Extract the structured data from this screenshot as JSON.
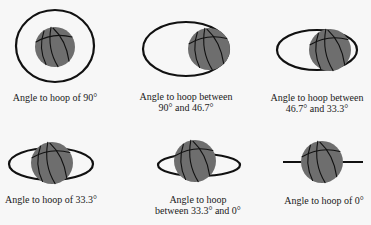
{
  "figure": {
    "colors": {
      "background": "#f7f7f7",
      "hoop_stroke": "#111111",
      "ball_fill": "#6e6e6e",
      "text": "#1a1a1a"
    },
    "panels": [
      {
        "id": "angle-90",
        "caption_lines": [
          "Angle to hoop of  90°"
        ],
        "hoop": {
          "type": "ellipse",
          "cx": 55,
          "cy": 46,
          "rx": 39,
          "ry": 36
        },
        "ball": {
          "cx": 55,
          "cy": 47,
          "r": 20
        },
        "caption_x": 55,
        "caption_y": [
          101
        ]
      },
      {
        "id": "angle-90-to-46-7",
        "caption_lines": [
          "Angle to hoop between",
          "90° and  46.7°"
        ],
        "hoop": {
          "type": "ellipse",
          "cx": 186,
          "cy": 49,
          "rx": 43,
          "ry": 27
        },
        "ball": {
          "cx": 209,
          "cy": 49,
          "r": 21
        },
        "caption_x": 186,
        "caption_y": [
          100,
          111
        ]
      },
      {
        "id": "angle-46-7-to-33-3",
        "caption_lines": [
          "Angle to hoop between",
          "46.7° and  33.3°"
        ],
        "hoop": {
          "type": "ellipse",
          "cx": 317,
          "cy": 50,
          "rx": 40,
          "ry": 20
        },
        "ball": {
          "cx": 330,
          "cy": 50,
          "r": 21
        },
        "caption_x": 317,
        "caption_y": [
          101,
          112
        ]
      },
      {
        "id": "angle-33-3",
        "caption_lines": [
          "Angle to hoop of 33.3°"
        ],
        "hoop": {
          "type": "ellipse",
          "cx": 51,
          "cy": 164,
          "rx": 42,
          "ry": 16
        },
        "ball": {
          "cx": 52,
          "cy": 163,
          "r": 21
        },
        "caption_x": 51,
        "caption_y": [
          203
        ]
      },
      {
        "id": "angle-33-3-to-0",
        "caption_lines": [
          "Angle to hoop",
          "between 33.3° and 0°"
        ],
        "hoop": {
          "type": "ellipse",
          "cx": 199,
          "cy": 165,
          "rx": 41,
          "ry": 11
        },
        "ball": {
          "cx": 195,
          "cy": 161,
          "r": 21
        },
        "caption_x": 198,
        "caption_y": [
          203,
          214
        ]
      },
      {
        "id": "angle-0",
        "caption_lines": [
          "Angle to hoop of 0°"
        ],
        "hoop": {
          "type": "line",
          "x1": 283,
          "x2": 363,
          "y": 162
        },
        "ball": {
          "cx": 322,
          "cy": 162,
          "r": 21
        },
        "caption_x": 324,
        "caption_y": [
          204
        ]
      }
    ]
  }
}
